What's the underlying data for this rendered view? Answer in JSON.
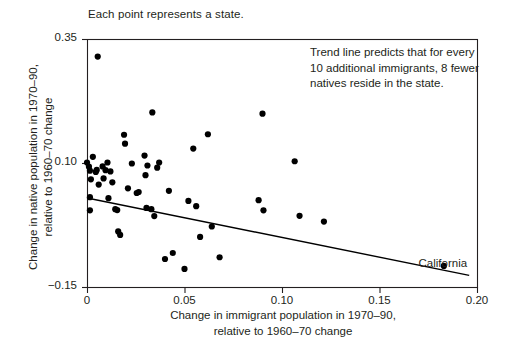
{
  "figure": {
    "caption_top": "Each point represents a state.",
    "annotation_lines": [
      "Trend line predicts that for every",
      "10 additional immigrants, 8 fewer",
      "natives reside in the state."
    ],
    "point_label": "California",
    "axis_color": "#231f20",
    "point_color": "#000000",
    "line_color": "#000000"
  },
  "chart_data": {
    "type": "scatter",
    "title": "Each point represents a state.",
    "xlabel_lines": [
      "Change in immigrant population in 1970–90,",
      "relative to 1960–70 change"
    ],
    "ylabel_lines": [
      "Change in native population in 1970–90,",
      "relative to 1960–70 change"
    ],
    "xlabel": "Change in immigrant population in 1970–90, relative to 1960–70 change",
    "ylabel": "Change in native population in 1970–90, relative to 1960–70 change",
    "xlim": [
      0,
      0.2
    ],
    "ylim": [
      -0.15,
      0.35
    ],
    "xticks": [
      0,
      0.05,
      0.1,
      0.15,
      0.2
    ],
    "xtick_labels": [
      "0",
      "0.05",
      "0.10",
      "0.15",
      "0.20"
    ],
    "yticks": [
      -0.15,
      0.1,
      0.35
    ],
    "ytick_labels": [
      "−0.15",
      "0.10",
      "0.35"
    ],
    "grid": false,
    "legend": null,
    "annotations": [
      {
        "text": "Trend line predicts that for every 10 additional immigrants, 8 fewer natives reside in the state.",
        "x": 0.115,
        "y": 0.315
      },
      {
        "text": "California",
        "x": 0.17,
        "y": -0.106
      }
    ],
    "trend_line": {
      "slope": -0.8,
      "x": [
        0.0,
        0.196
      ],
      "y": [
        0.0295,
        -0.1265
      ]
    },
    "points": [
      {
        "x": 0.0055,
        "y": 0.3145
      },
      {
        "x": 0.0,
        "y": 0.101
      },
      {
        "x": 0.001,
        "y": 0.0925
      },
      {
        "x": 0.0015,
        "y": 0.0845
      },
      {
        "x": 0.0015,
        "y": 0.031
      },
      {
        "x": 0.0015,
        "y": 0.0045
      },
      {
        "x": 0.002,
        "y": 0.067
      },
      {
        "x": 0.003,
        "y": 0.1125
      },
      {
        "x": 0.0045,
        "y": 0.082
      },
      {
        "x": 0.005,
        "y": 0.086
      },
      {
        "x": 0.006,
        "y": 0.0565
      },
      {
        "x": 0.008,
        "y": 0.093
      },
      {
        "x": 0.0085,
        "y": 0.069
      },
      {
        "x": 0.0095,
        "y": 0.0855
      },
      {
        "x": 0.0105,
        "y": 0.101
      },
      {
        "x": 0.011,
        "y": 0.029
      },
      {
        "x": 0.012,
        "y": 0.083
      },
      {
        "x": 0.013,
        "y": 0.061
      },
      {
        "x": 0.0145,
        "y": 0.007
      },
      {
        "x": 0.0155,
        "y": 0.005
      },
      {
        "x": 0.016,
        "y": -0.038
      },
      {
        "x": 0.017,
        "y": -0.045
      },
      {
        "x": 0.019,
        "y": 0.157
      },
      {
        "x": 0.0195,
        "y": 0.139
      },
      {
        "x": 0.021,
        "y": 0.049
      },
      {
        "x": 0.023,
        "y": 0.099
      },
      {
        "x": 0.0255,
        "y": 0.0395
      },
      {
        "x": 0.0265,
        "y": 0.0415
      },
      {
        "x": 0.0295,
        "y": 0.115
      },
      {
        "x": 0.03,
        "y": 0.0755
      },
      {
        "x": 0.0305,
        "y": 0.0095
      },
      {
        "x": 0.031,
        "y": 0.095
      },
      {
        "x": 0.033,
        "y": 0.007
      },
      {
        "x": 0.0335,
        "y": 0.202
      },
      {
        "x": 0.0345,
        "y": -0.007
      },
      {
        "x": 0.036,
        "y": 0.0905
      },
      {
        "x": 0.037,
        "y": 0.101
      },
      {
        "x": 0.04,
        "y": -0.0935
      },
      {
        "x": 0.042,
        "y": 0.044
      },
      {
        "x": 0.044,
        "y": -0.0815
      },
      {
        "x": 0.05,
        "y": -0.1135
      },
      {
        "x": 0.052,
        "y": 0.0235
      },
      {
        "x": 0.0545,
        "y": 0.129
      },
      {
        "x": 0.056,
        "y": 0.013
      },
      {
        "x": 0.058,
        "y": -0.049
      },
      {
        "x": 0.062,
        "y": 0.158
      },
      {
        "x": 0.064,
        "y": -0.028
      },
      {
        "x": 0.068,
        "y": -0.09
      },
      {
        "x": 0.088,
        "y": 0.025
      },
      {
        "x": 0.09,
        "y": 0.1995
      },
      {
        "x": 0.0905,
        "y": 0.0045
      },
      {
        "x": 0.1065,
        "y": 0.1035
      },
      {
        "x": 0.109,
        "y": -0.0065
      },
      {
        "x": 0.1215,
        "y": -0.018
      },
      {
        "x": 0.183,
        "y": -0.1075
      }
    ]
  }
}
